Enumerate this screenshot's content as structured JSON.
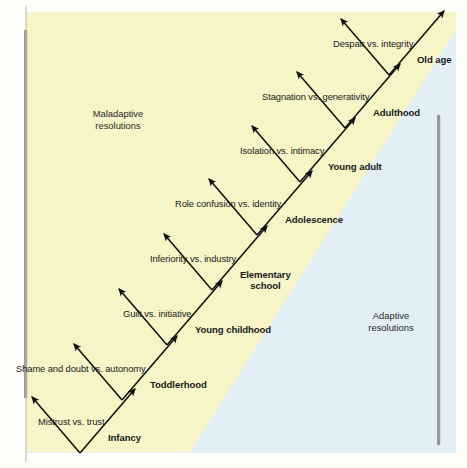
{
  "figure": {
    "background_color": "#fdfdfa",
    "band_yellow": "#f7f4c8",
    "band_blue": "#e2eff7",
    "bar_color": "#8a8a82",
    "text_color": "#1a1a1a"
  },
  "regions": {
    "maladaptive": {
      "line1": "Maladaptive",
      "line2": "resolutions"
    },
    "adaptive": {
      "line1": "Adaptive",
      "line2": "resolutions"
    }
  },
  "chart_data": {
    "type": "diagram",
    "legend": [
      "Maladaptive resolutions",
      "Adaptive resolutions"
    ],
    "stages": [
      {
        "crisis": "Mistrust vs. trust",
        "stage": "Infancy",
        "vertex_x": 80,
        "vertex_y": 453
      },
      {
        "crisis": "Shame and doubt vs. autonomy",
        "stage": "Toddlerhood",
        "vertex_x": 122,
        "vertex_y": 400
      },
      {
        "crisis": "Guilt vs. initiative",
        "stage": "Young childhood",
        "vertex_x": 167,
        "vertex_y": 345
      },
      {
        "crisis": "Inferiority vs. industry",
        "stage": "Elementary school",
        "vertex_x": 212,
        "vertex_y": 290
      },
      {
        "crisis": "Role confusion vs. identity",
        "stage": "Adolescence",
        "vertex_x": 257,
        "vertex_y": 235
      },
      {
        "crisis": "Isolation vs. intimacy",
        "stage": "Young adult",
        "vertex_x": 300,
        "vertex_y": 182
      },
      {
        "crisis": "Stagnation vs. generativity",
        "stage": "Adulthood",
        "vertex_x": 345,
        "vertex_y": 128
      },
      {
        "crisis": "Despair vs. integrity",
        "stage": "Old age",
        "vertex_x": 389,
        "vertex_y": 75
      }
    ]
  }
}
